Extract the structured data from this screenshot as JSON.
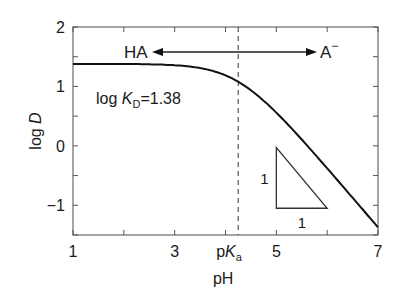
{
  "chart_data": {
    "type": "line",
    "title": "",
    "xlabel": "pH",
    "ylabel": "log D",
    "xlim": [
      1,
      7
    ],
    "ylim": [
      -1.5,
      2
    ],
    "x_ticks": [
      1,
      2,
      3,
      4,
      5,
      6,
      7
    ],
    "x_tick_labels": [
      {
        "value": 1,
        "label": "1"
      },
      {
        "value": 3,
        "label": "3"
      },
      {
        "value": 5,
        "label": "5"
      },
      {
        "value": 7,
        "label": "7"
      }
    ],
    "y_ticks": [
      -1.5,
      -1,
      -0.5,
      0,
      0.5,
      1,
      1.5,
      2
    ],
    "y_tick_labels": [
      {
        "value": 2,
        "label": "2"
      },
      {
        "value": 1,
        "label": "1"
      },
      {
        "value": 0,
        "label": "0"
      },
      {
        "value": -1,
        "label": "−1"
      }
    ],
    "grid": false,
    "log_KD": 1.38,
    "pKa": 4.25,
    "series": [
      {
        "name": "log D",
        "formula": "log D = log KD - log(1 + 10^(pH - pKa))",
        "x": [
          1,
          2,
          3,
          3.5,
          4,
          4.25,
          4.5,
          5,
          5.5,
          6,
          6.5,
          7
        ],
        "values": [
          1.38,
          1.38,
          1.35,
          1.3,
          1.18,
          1.08,
          0.96,
          0.61,
          0.14,
          -0.38,
          -0.87,
          -1.37
        ]
      }
    ],
    "annotations": {
      "ha_label": "HA",
      "a_minus_base": "A",
      "a_minus_sup": "−",
      "kd_prefix": "log ",
      "kd_var": "K",
      "kd_sub": "D",
      "kd_value": "=1.38",
      "pka_p": "p",
      "pka_var": "K",
      "pka_sub": "a",
      "slope_rise_label": "1",
      "slope_run_label": "1"
    },
    "slope_triangle": {
      "x_start": 5,
      "x_end": 6,
      "y_top": -0.03,
      "y_bottom": -1.05
    }
  }
}
